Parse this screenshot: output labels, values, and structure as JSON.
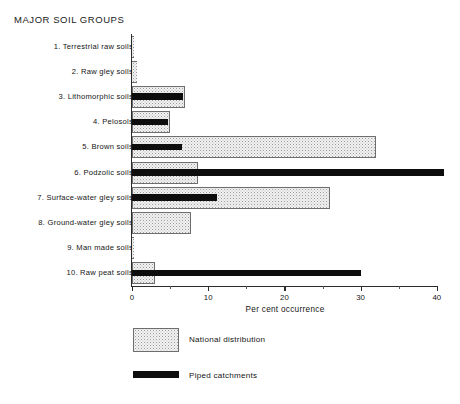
{
  "chart_data": {
    "type": "bar",
    "orientation": "horizontal",
    "title": "MAJOR SOIL GROUPS",
    "xlabel": "Per cent occurrence",
    "ylabel": "",
    "xlim": [
      0,
      40
    ],
    "xticks": [
      0,
      10,
      20,
      30,
      40
    ],
    "xticklabels": [
      "0",
      "10",
      "20",
      "30",
      "40"
    ],
    "xminorticks": [
      5,
      15,
      25,
      35
    ],
    "grid": false,
    "legend_position": "bottom-left",
    "categories": [
      "1. Terrestrial raw soils",
      "2. Raw gley soils",
      "3. Lithomorphic soils",
      "4. Pelosols",
      "5. Brown soils",
      "6. Podzolic soils",
      "7. Surface-water gley soils",
      "8. Ground-water gley soils",
      "9. Man made soils",
      "10. Raw peat soils"
    ],
    "series": [
      {
        "name": "National distribution",
        "color": "#f2f2f2",
        "pattern": "stipple",
        "values": [
          0.2,
          0.6,
          7.0,
          5.0,
          32.0,
          8.7,
          26.0,
          7.8,
          0.3,
          3.0
        ]
      },
      {
        "name": "Piped catchments",
        "color": "#0d0d0d",
        "pattern": "solid",
        "values": [
          0,
          0,
          6.7,
          4.7,
          6.5,
          41.0,
          11.2,
          0,
          0,
          30.0
        ]
      }
    ]
  },
  "legend": {
    "items": [
      {
        "label": "National distribution",
        "swatch": "stipple-swatch"
      },
      {
        "label": "Piped catchments",
        "swatch": "solid-black-swatch"
      }
    ]
  }
}
